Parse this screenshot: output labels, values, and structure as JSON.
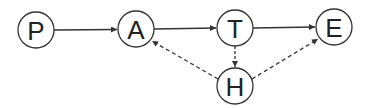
{
  "diagram": {
    "type": "directed-graph",
    "nodes": [
      {
        "id": "P",
        "label": "P",
        "cx": 36,
        "cy": 30
      },
      {
        "id": "A",
        "label": "A",
        "cx": 136,
        "cy": 29
      },
      {
        "id": "T",
        "label": "T",
        "cx": 235,
        "cy": 28
      },
      {
        "id": "E",
        "label": "E",
        "cx": 334,
        "cy": 27
      },
      {
        "id": "H",
        "label": "H",
        "cx": 235,
        "cy": 86
      }
    ],
    "edges": [
      {
        "from": "P",
        "to": "A",
        "style": "solid"
      },
      {
        "from": "A",
        "to": "T",
        "style": "solid"
      },
      {
        "from": "T",
        "to": "E",
        "style": "solid"
      },
      {
        "from": "T",
        "to": "H",
        "style": "dashed"
      },
      {
        "from": "H",
        "to": "A",
        "style": "dashed"
      },
      {
        "from": "H",
        "to": "E",
        "style": "dashed"
      }
    ],
    "colors": {
      "stroke": "#333333",
      "background": "#ffffff"
    }
  }
}
